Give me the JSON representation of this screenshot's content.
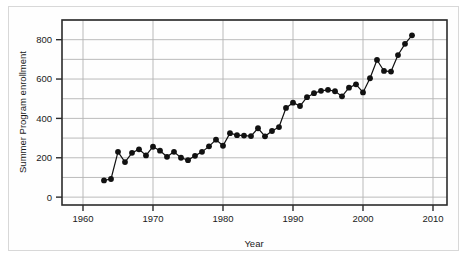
{
  "chart_data": {
    "type": "line",
    "title": "",
    "xlabel": "Year",
    "ylabel": "Summer Program enrollment",
    "xlim": [
      1957,
      2012
    ],
    "ylim": [
      -40,
      900
    ],
    "xticks": [
      1960,
      1970,
      1980,
      1990,
      2000,
      2010
    ],
    "yticks": [
      0,
      200,
      400,
      600,
      800
    ],
    "gridlines_y": [
      0,
      100,
      200,
      300,
      400,
      500,
      600,
      700,
      800,
      900
    ],
    "gridlines_x": [
      1960,
      1970,
      1980,
      1990,
      2000,
      2010
    ],
    "grid": true,
    "legend": "none",
    "marker": "filled-circle",
    "marker_color": "#111111",
    "line_color": "#111111",
    "x": [
      1963,
      1964,
      1965,
      1966,
      1967,
      1968,
      1969,
      1970,
      1971,
      1972,
      1973,
      1974,
      1975,
      1976,
      1977,
      1978,
      1979,
      1980,
      1981,
      1982,
      1983,
      1984,
      1985,
      1986,
      1987,
      1988,
      1989,
      1990,
      1991,
      1992,
      1993,
      1994,
      1995,
      1996,
      1997,
      1998,
      1999,
      2000,
      2001,
      2002,
      2003,
      2004,
      2005,
      2006,
      2007
    ],
    "values": [
      85,
      92,
      230,
      178,
      225,
      243,
      212,
      256,
      236,
      205,
      230,
      200,
      188,
      210,
      230,
      258,
      292,
      261,
      325,
      315,
      313,
      310,
      350,
      309,
      336,
      356,
      453,
      480,
      463,
      508,
      528,
      540,
      545,
      538,
      512,
      556,
      573,
      532,
      604,
      697,
      641,
      638,
      722,
      779,
      822
    ],
    "series_name": "Summer Program enrollment"
  },
  "axes": {
    "x_tick_labels": [
      "1960",
      "1970",
      "1980",
      "1990",
      "2000",
      "2010"
    ],
    "y_tick_labels": [
      "0",
      "200",
      "400",
      "600",
      "800"
    ],
    "x_axis_title": "Year",
    "y_axis_title": "Summer Program enrollment"
  },
  "style": {
    "background": "#ffffff",
    "grid_color": "#b3b3b3",
    "frame_color": "#2b2b2b",
    "outer_border_color": "#d8d8d8",
    "data_color": "#111111"
  }
}
